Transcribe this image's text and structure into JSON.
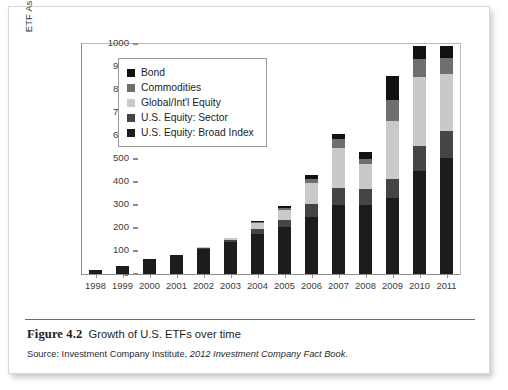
{
  "figure": {
    "caption_figure_no": "Figure 4.2",
    "caption_title": "Growth of U.S. ETFs over time",
    "source_prefix": "Source: Investment Company Institute,",
    "source_italic": "2012 Investment Company Fact Book",
    "source_suffix": "."
  },
  "colors": {
    "bond": "#111111",
    "commodities": "#6f6f6f",
    "global_intl_equity": "#c9c9c9",
    "us_equity_sector": "#454545",
    "us_equity_broad_index": "#1c1c1c",
    "axis": "#8d8d8d",
    "frame": "#b9b9b9",
    "text": "#1d1d1d"
  },
  "legend": {
    "position": "top-left-inside",
    "items": [
      {
        "label": "Bond",
        "color": "#111111"
      },
      {
        "label": "Commodities",
        "color": "#6f6f6f"
      },
      {
        "label": "Global/Int'l Equity",
        "color": "#c9c9c9"
      },
      {
        "label": "U.S. Equity: Sector",
        "color": "#454545"
      },
      {
        "label": "U.S. Equity: Broad Index",
        "color": "#1c1c1c"
      }
    ]
  },
  "chart_data": {
    "type": "bar",
    "stacked": true,
    "title": "Growth of U.S. ETFs over time",
    "xlabel": "",
    "ylabel": "ETF Assets ($ million)",
    "ylim": [
      0,
      1000
    ],
    "ytick_step": 100,
    "yticks": [
      0,
      100,
      200,
      300,
      400,
      500,
      600,
      700,
      800,
      900,
      1000
    ],
    "grid": false,
    "categories": [
      "1998",
      "1999",
      "2000",
      "2001",
      "2002",
      "2003",
      "2004",
      "2005",
      "2006",
      "2007",
      "2008",
      "2009",
      "2010",
      "2011"
    ],
    "series": [
      {
        "name": "U.S. Equity: Broad Index",
        "color": "#1c1c1c",
        "values": [
          16,
          33,
          66,
          83,
          110,
          140,
          175,
          205,
          250,
          300,
          300,
          330,
          450,
          505
        ]
      },
      {
        "name": "U.S. Equity: Sector",
        "color": "#454545",
        "values": [
          0,
          0,
          0,
          0,
          4,
          9,
          22,
          30,
          55,
          75,
          70,
          85,
          105,
          115
        ]
      },
      {
        "name": "Global/Int'l Equity",
        "color": "#c9c9c9",
        "values": [
          0,
          0,
          0,
          0,
          3,
          6,
          25,
          45,
          90,
          175,
          110,
          250,
          300,
          250
        ]
      },
      {
        "name": "Commodities",
        "color": "#6f6f6f",
        "values": [
          0,
          0,
          0,
          0,
          0,
          0,
          4,
          8,
          18,
          35,
          22,
          90,
          80,
          70
        ]
      },
      {
        "name": "Bond",
        "color": "#111111",
        "values": [
          0,
          0,
          0,
          0,
          0,
          0,
          4,
          7,
          17,
          25,
          30,
          105,
          55,
          50
        ]
      }
    ],
    "totals": [
      16,
      33,
      66,
      83,
      117,
      155,
      230,
      295,
      430,
      610,
      532,
      860,
      990,
      990
    ]
  }
}
